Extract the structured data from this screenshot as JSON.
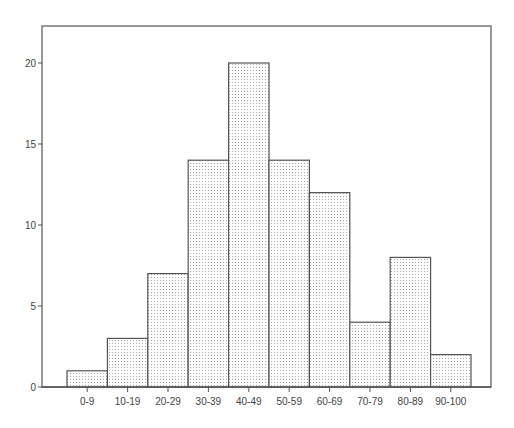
{
  "chart_data": {
    "type": "bar",
    "title": "",
    "xlabel": "",
    "ylabel": "",
    "categories": [
      "0-9",
      "10-19",
      "20-29",
      "30-39",
      "40-49",
      "50-59",
      "60-69",
      "70-79",
      "80-89",
      "90-100"
    ],
    "values": [
      1,
      3,
      7,
      14,
      20,
      14,
      12,
      4,
      8,
      2
    ],
    "ylim": [
      0,
      22
    ],
    "yticks": [
      0,
      5,
      10,
      15,
      20
    ],
    "grid": false,
    "legend": null,
    "bar_fill": "dotted pattern",
    "colors": {
      "bar_fill": "#ffffff",
      "bar_dots": "#9a9a9a",
      "bar_edge": "#555555",
      "axis": "#555555",
      "frame": "#777777"
    }
  }
}
